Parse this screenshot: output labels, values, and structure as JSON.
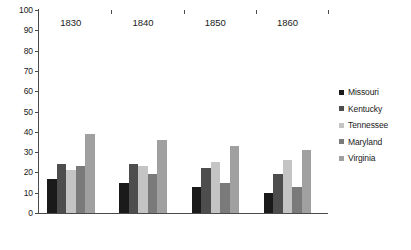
{
  "chart_data": {
    "type": "bar",
    "title": "",
    "subtitle": "",
    "xlabel": "",
    "ylabel": "",
    "categories": [
      "1830",
      "1840",
      "1850",
      "1860"
    ],
    "ylim": [
      0,
      100
    ],
    "y_ticks": [
      0,
      10,
      20,
      30,
      40,
      50,
      60,
      70,
      80,
      90,
      100
    ],
    "y_tick_labels": [
      "0",
      "10",
      "20",
      "30",
      "40",
      "50",
      "60",
      "70",
      "80",
      "90",
      "100"
    ],
    "grid": false,
    "legend_position": "right",
    "series": [
      {
        "name": "Missouri",
        "color": "#1a1a1a",
        "values": [
          17,
          15,
          13,
          10
        ]
      },
      {
        "name": "Kentucky",
        "color": "#4d4d4d",
        "values": [
          24,
          24,
          22,
          19
        ]
      },
      {
        "name": "Tennessee",
        "color": "#c4c4c4",
        "values": [
          21,
          23,
          25,
          26
        ]
      },
      {
        "name": "Maryland",
        "color": "#7a7a7a",
        "values": [
          23,
          19,
          15,
          13
        ]
      },
      {
        "name": "Virginia",
        "color": "#a0a0a0",
        "values": [
          39,
          36,
          33,
          31
        ]
      }
    ]
  },
  "legend": {
    "items": [
      "Missouri",
      "Kentucky",
      "Tennessee",
      "Maryland",
      "Virginia"
    ]
  }
}
